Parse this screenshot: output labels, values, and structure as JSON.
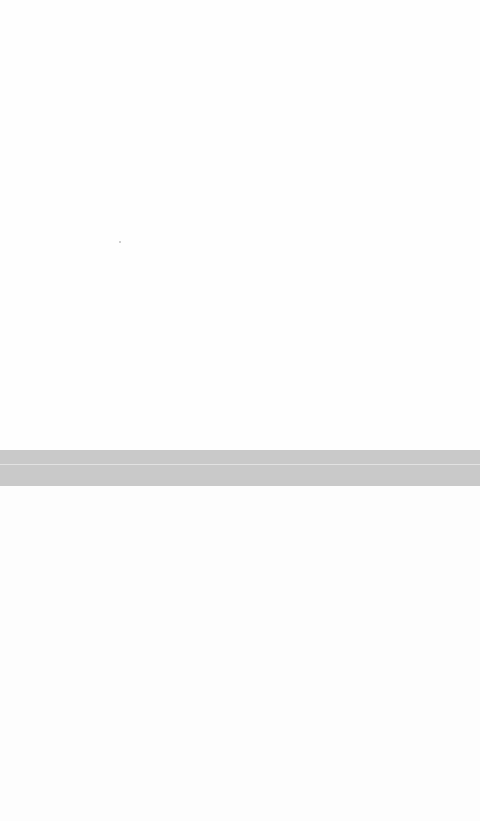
{
  "screen": {
    "state": "blank",
    "colors": {
      "background": "#fdfdfd",
      "divider_band": "#c9c9c9",
      "divider_highlight": "#e2e2e2"
    }
  },
  "top_pane": {
    "content": ""
  },
  "divider": {
    "label": ""
  },
  "bottom_pane": {
    "content": ""
  }
}
